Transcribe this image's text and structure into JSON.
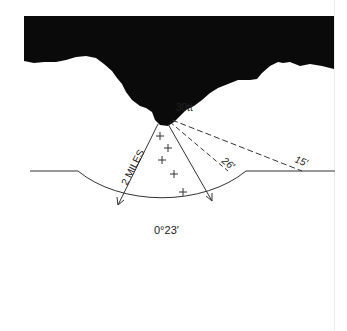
{
  "diagram": {
    "type": "underwater canyon sonar / line-of-sight diagram",
    "labels": {
      "vessel": "30tt",
      "radius": "2 MILES",
      "angle_26": "26′",
      "angle_15": "15′",
      "arc_angle": "0°23′"
    },
    "markers": {
      "count": 5,
      "symbol": "+"
    },
    "colors": {
      "silhouette": "#0a0a0a",
      "line": "#333333",
      "background": "#ffffff"
    }
  }
}
